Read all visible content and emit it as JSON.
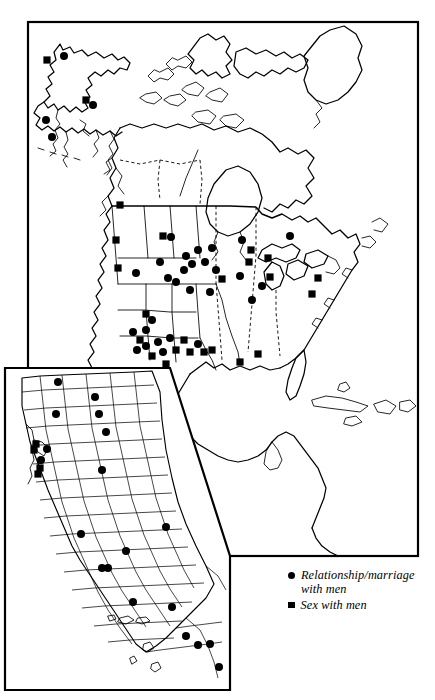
{
  "figure": {
    "type": "distribution-map",
    "region": "North America",
    "inset_region": "California",
    "projection_note": "outline map with political boundaries"
  },
  "legend": {
    "position": "bottom-right",
    "entries": [
      {
        "marker": "circle",
        "marker_name": "circle-marker",
        "label": "Relationship/marriage\nwith men"
      },
      {
        "marker": "square",
        "marker_name": "square-marker",
        "label": "Sex with men"
      }
    ]
  },
  "symbology": {
    "circle_meaning": "Relationship/marriage with men",
    "square_meaning": "Sex with men",
    "marker_color": "#000000",
    "background_color": "#ffffff",
    "outline_color": "#000000"
  },
  "chart_data": {
    "type": "scatter",
    "title": "",
    "xlabel": "",
    "ylabel": "",
    "series": [
      {
        "name": "Relationship/marriage with men",
        "marker": "circle",
        "count_main_map": 41,
        "count_inset": 22
      },
      {
        "name": "Sex with men",
        "marker": "square",
        "count_main_map": 33,
        "count_inset": 5
      }
    ],
    "main_map_points": [
      {
        "x": 47,
        "y": 60,
        "m": "square"
      },
      {
        "x": 64,
        "y": 56,
        "m": "circle"
      },
      {
        "x": 86,
        "y": 100,
        "m": "square"
      },
      {
        "x": 93,
        "y": 105,
        "m": "circle"
      },
      {
        "x": 46,
        "y": 120,
        "m": "circle"
      },
      {
        "x": 52,
        "y": 137,
        "m": "circle"
      },
      {
        "x": 120,
        "y": 205,
        "m": "square"
      },
      {
        "x": 116,
        "y": 240,
        "m": "square"
      },
      {
        "x": 118,
        "y": 268,
        "m": "square"
      },
      {
        "x": 136,
        "y": 273,
        "m": "circle"
      },
      {
        "x": 163,
        "y": 236,
        "m": "square"
      },
      {
        "x": 171,
        "y": 237,
        "m": "circle"
      },
      {
        "x": 160,
        "y": 262,
        "m": "circle"
      },
      {
        "x": 168,
        "y": 278,
        "m": "circle"
      },
      {
        "x": 184,
        "y": 270,
        "m": "circle"
      },
      {
        "x": 186,
        "y": 256,
        "m": "circle"
      },
      {
        "x": 192,
        "y": 264,
        "m": "circle"
      },
      {
        "x": 198,
        "y": 250,
        "m": "circle"
      },
      {
        "x": 205,
        "y": 262,
        "m": "circle"
      },
      {
        "x": 212,
        "y": 248,
        "m": "circle"
      },
      {
        "x": 190,
        "y": 290,
        "m": "circle"
      },
      {
        "x": 176,
        "y": 282,
        "m": "circle"
      },
      {
        "x": 216,
        "y": 270,
        "m": "circle"
      },
      {
        "x": 222,
        "y": 279,
        "m": "square"
      },
      {
        "x": 210,
        "y": 292,
        "m": "circle"
      },
      {
        "x": 146,
        "y": 314,
        "m": "square"
      },
      {
        "x": 152,
        "y": 320,
        "m": "circle"
      },
      {
        "x": 140,
        "y": 340,
        "m": "square"
      },
      {
        "x": 146,
        "y": 346,
        "m": "circle"
      },
      {
        "x": 137,
        "y": 350,
        "m": "circle"
      },
      {
        "x": 152,
        "y": 356,
        "m": "square"
      },
      {
        "x": 158,
        "y": 342,
        "m": "circle"
      },
      {
        "x": 163,
        "y": 352,
        "m": "circle"
      },
      {
        "x": 170,
        "y": 338,
        "m": "circle"
      },
      {
        "x": 176,
        "y": 350,
        "m": "square"
      },
      {
        "x": 184,
        "y": 340,
        "m": "square"
      },
      {
        "x": 190,
        "y": 352,
        "m": "square"
      },
      {
        "x": 198,
        "y": 344,
        "m": "circle"
      },
      {
        "x": 204,
        "y": 352,
        "m": "square"
      },
      {
        "x": 212,
        "y": 350,
        "m": "square"
      },
      {
        "x": 166,
        "y": 364,
        "m": "square"
      },
      {
        "x": 146,
        "y": 330,
        "m": "circle"
      },
      {
        "x": 133,
        "y": 332,
        "m": "circle"
      },
      {
        "x": 242,
        "y": 240,
        "m": "circle"
      },
      {
        "x": 251,
        "y": 250,
        "m": "square"
      },
      {
        "x": 249,
        "y": 262,
        "m": "square"
      },
      {
        "x": 240,
        "y": 276,
        "m": "circle"
      },
      {
        "x": 262,
        "y": 286,
        "m": "circle"
      },
      {
        "x": 252,
        "y": 300,
        "m": "circle"
      },
      {
        "x": 270,
        "y": 277,
        "m": "square"
      },
      {
        "x": 290,
        "y": 236,
        "m": "circle"
      },
      {
        "x": 268,
        "y": 258,
        "m": "square"
      },
      {
        "x": 318,
        "y": 278,
        "m": "square"
      },
      {
        "x": 312,
        "y": 294,
        "m": "square"
      },
      {
        "x": 240,
        "y": 362,
        "m": "square"
      },
      {
        "x": 258,
        "y": 354,
        "m": "square"
      }
    ],
    "inset_points": [
      {
        "x": 58,
        "y": 382,
        "m": "circle"
      },
      {
        "x": 95,
        "y": 397,
        "m": "circle"
      },
      {
        "x": 56,
        "y": 414,
        "m": "circle"
      },
      {
        "x": 99,
        "y": 414,
        "m": "circle"
      },
      {
        "x": 106,
        "y": 432,
        "m": "circle"
      },
      {
        "x": 36,
        "y": 444,
        "m": "square"
      },
      {
        "x": 34,
        "y": 450,
        "m": "square"
      },
      {
        "x": 47,
        "y": 449,
        "m": "circle"
      },
      {
        "x": 41,
        "y": 460,
        "m": "circle"
      },
      {
        "x": 40,
        "y": 468,
        "m": "square"
      },
      {
        "x": 38,
        "y": 474,
        "m": "square"
      },
      {
        "x": 102,
        "y": 470,
        "m": "circle"
      },
      {
        "x": 81,
        "y": 534,
        "m": "circle"
      },
      {
        "x": 126,
        "y": 551,
        "m": "circle"
      },
      {
        "x": 166,
        "y": 527,
        "m": "circle"
      },
      {
        "x": 102,
        "y": 568,
        "m": "circle"
      },
      {
        "x": 108,
        "y": 568,
        "m": "circle"
      },
      {
        "x": 133,
        "y": 602,
        "m": "circle"
      },
      {
        "x": 172,
        "y": 607,
        "m": "circle"
      },
      {
        "x": 186,
        "y": 636,
        "m": "circle"
      },
      {
        "x": 198,
        "y": 645,
        "m": "circle"
      },
      {
        "x": 210,
        "y": 644,
        "m": "circle"
      },
      {
        "x": 219,
        "y": 667,
        "m": "circle"
      }
    ]
  }
}
